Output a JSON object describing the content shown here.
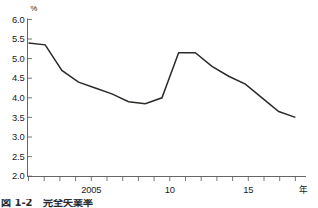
{
  "chart_data": {
    "type": "line",
    "title": "",
    "subtitle": "",
    "xlabel": "年",
    "ylabel": "%",
    "unit_top_left": "%",
    "xlim": [
      2000.5,
      2017.5
    ],
    "ylim": [
      2.0,
      6.0
    ],
    "grid": false,
    "legend": null,
    "y_ticks": [
      "2.0",
      "2.5",
      "3.0",
      "3.5",
      "4.0",
      "4.5",
      "5.0",
      "5.5",
      "6.0"
    ],
    "y_tick_values": [
      2.0,
      2.5,
      3.0,
      3.5,
      4.0,
      4.5,
      5.0,
      5.5,
      6.0
    ],
    "x_tick_values": [
      2001,
      2002,
      2003,
      2004,
      2005,
      2006,
      2007,
      2008,
      2009,
      2010,
      2011,
      2012,
      2013,
      2014,
      2015,
      2016,
      2017
    ],
    "x_tick_labels": [
      "",
      "",
      "",
      "",
      "2005",
      "",
      "",
      "",
      "",
      "10",
      "",
      "",
      "",
      "",
      "15",
      "",
      ""
    ],
    "x": [
      2001,
      2002,
      2003,
      2004,
      2005,
      2006,
      2007,
      2008,
      2009,
      2010,
      2011,
      2012,
      2013,
      2014,
      2015,
      2016,
      2017
    ],
    "values": [
      5.4,
      5.35,
      4.7,
      4.4,
      4.25,
      4.1,
      3.9,
      3.85,
      4.0,
      5.15,
      5.15,
      4.8,
      4.55,
      4.35,
      4.0,
      3.65,
      3.5
    ],
    "series": [
      {
        "name": "完全失業率",
        "values": [
          5.4,
          5.35,
          4.7,
          4.4,
          4.25,
          4.1,
          3.9,
          3.85,
          4.0,
          5.15,
          5.15,
          4.8,
          4.55,
          4.35,
          4.0,
          3.65,
          3.5
        ]
      }
    ],
    "line_color": "#2b2b28",
    "axis_color": "#555555"
  },
  "caption": {
    "text": "図 1-2　完全失業率"
  },
  "axis": {
    "unit_percent": "%",
    "unit_year": "年"
  }
}
